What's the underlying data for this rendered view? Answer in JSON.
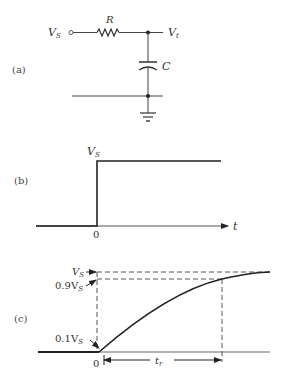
{
  "figure": {
    "panels": [
      {
        "id": "a",
        "label": "(a)"
      },
      {
        "id": "b",
        "label": "(b)"
      },
      {
        "id": "c",
        "label": "(c)"
      }
    ],
    "circuit": {
      "source_label": "V",
      "source_sub": "S",
      "resistor_label": "R",
      "output_label": "V",
      "output_sub": "t",
      "capacitor_label": "C"
    },
    "step": {
      "level_label": "V",
      "level_sub": "S",
      "zero_label": "0",
      "axis_label": "t"
    },
    "response": {
      "vs_label": "V",
      "vs_sub": "S",
      "v90_label": "0.9V",
      "v90_sub": "S",
      "v10_label": "0.1V",
      "v10_sub": "S",
      "zero_label": "0",
      "rise_label": "t",
      "rise_sub": "r"
    }
  }
}
